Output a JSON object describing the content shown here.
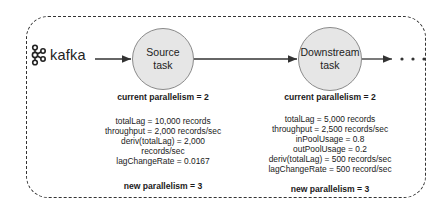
{
  "source": {
    "name": "kafka",
    "icon": "kafka-logo-icon"
  },
  "nodes": [
    {
      "id": "source",
      "line1": "Source",
      "line2": "task",
      "current_parallelism": "current parallelism = 2",
      "metrics": [
        "totalLag = 10,000 records",
        "throughput = 2,000 records/sec",
        "deriv(totalLag) = 2,000",
        "records/sec",
        "lagChangeRate = 0.0167"
      ],
      "new_parallelism": "new parallelism = 3"
    },
    {
      "id": "downstream",
      "line1": "Downstream",
      "line2": "task",
      "current_parallelism": "current parallelism = 2",
      "metrics": [
        "totalLag = 5,000 records",
        "throughput = 2,500 records/sec",
        "inPoolUsage = 0.8",
        "outPoolUsage = 0.2",
        "deriv(totalLag) = 500 records/sec",
        "lagChangeRate = 500 record/sec"
      ],
      "new_parallelism": "new parallelism = 3"
    }
  ],
  "continuation": "...",
  "colors": {
    "node_fill": "#e6e6e6",
    "node_border": "#8a8a8a",
    "line": "#333333"
  }
}
